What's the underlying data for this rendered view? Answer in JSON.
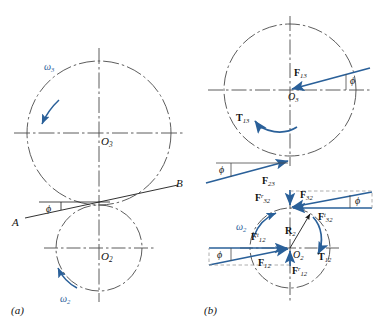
{
  "figure": {
    "colors": {
      "centerline": "#4a4a4a",
      "force_blue": "#2a6099",
      "line_black": "#1a1a1a",
      "background": "#ffffff"
    },
    "panels": [
      {
        "tag": "(a)",
        "name": "kinematic-layout",
        "labels": {
          "center_upper": "O",
          "center_upper_sub": "3",
          "center_lower": "O",
          "center_lower_sub": "2",
          "omega_upper": "ω",
          "omega_upper_sub": "3",
          "omega_lower": "ω",
          "omega_lower_sub": "2",
          "pressure_angle": "ϕ",
          "line_start": "A",
          "line_end": "B"
        }
      },
      {
        "tag": "(b)",
        "name": "free-body-diagram",
        "labels": {
          "gear3_center": "O",
          "gear3_center_sub": "3",
          "gear2_center": "O",
          "gear2_center_sub": "2",
          "F13": "F",
          "F13_sub": "13",
          "T13": "T",
          "T13_sub": "13",
          "F23": "F",
          "F23_sub": "23",
          "F32r": "F",
          "F32r_sub": "32",
          "F32r_sup": "r",
          "F32t": "F",
          "F32t_sub": "32",
          "F32t_sup": "t",
          "F32": "F",
          "F32_sub": "32",
          "F12t": "F",
          "F12t_sub": "12",
          "F12t_sup": "t",
          "F12r": "F",
          "F12r_sub": "12",
          "F12r_sup": "r",
          "F12": "F",
          "F12_sub": "12",
          "R2": "R",
          "R2_sub": "2",
          "T12": "T",
          "T12_sub": "12",
          "omega2": "ω",
          "omega2_sub": "2",
          "phi_top": "ϕ",
          "phi_mid": "ϕ",
          "phi_f32": "ϕ",
          "phi_f12": "ϕ"
        }
      }
    ]
  },
  "panel_a": {
    "tag": "(a)",
    "O3": "O",
    "O3sub": "3",
    "O2": "O",
    "O2sub": "2",
    "w3": "ω",
    "w3sub": "3",
    "w2": "ω",
    "w2sub": "2",
    "phi": "ϕ",
    "A": "A",
    "B": "B"
  },
  "panel_b": {
    "tag": "(b)",
    "O3": "O",
    "O3sub": "3",
    "O2": "O",
    "O2sub": "2",
    "F13": "F",
    "F13sub": "13",
    "T13": "T",
    "T13sub": "13",
    "F23": "F",
    "F23sub": "23",
    "F32r": "F",
    "F32rsub": "32",
    "F32rsup": "r",
    "F32": "F",
    "F32sub": "32",
    "F32t": "F",
    "F32tsub": "32",
    "F32tsup": "t",
    "F12t": "F",
    "F12tsub": "12",
    "F12tsup": "t",
    "F12r": "F",
    "F12rsub": "12",
    "F12rsup": "r",
    "F12": "F",
    "F12sub": "12",
    "R2": "R",
    "R2sub": "2",
    "T12": "T",
    "T12sub": "12",
    "w2": "ω",
    "w2sub": "2",
    "phi1": "ϕ",
    "phi2": "ϕ",
    "phi3": "ϕ",
    "phi4": "ϕ"
  }
}
